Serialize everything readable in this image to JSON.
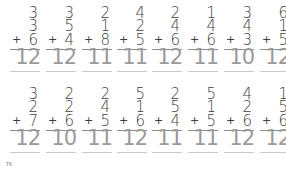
{
  "worksheet": {
    "rows": [
      {
        "problems": [
          {
            "a": "3",
            "b": "3",
            "c": "6",
            "op": "+",
            "answer": "12"
          },
          {
            "a": "3",
            "b": "5",
            "c": "4",
            "op": "+",
            "answer": "12"
          },
          {
            "a": "2",
            "b": "1",
            "c": "8",
            "op": "+",
            "answer": "11"
          },
          {
            "a": "4",
            "b": "2",
            "c": "5",
            "op": "+",
            "answer": "11"
          },
          {
            "a": "2",
            "b": "4",
            "c": "6",
            "op": "+",
            "answer": "12"
          },
          {
            "a": "1",
            "b": "4",
            "c": "6",
            "op": "+",
            "answer": "11"
          },
          {
            "a": "3",
            "b": "4",
            "c": "3",
            "op": "+",
            "answer": "10"
          },
          {
            "a": "6",
            "b": "1",
            "c": "5",
            "op": "+",
            "answer": "12"
          }
        ]
      },
      {
        "problems": [
          {
            "a": "3",
            "b": "2",
            "c": "7",
            "op": "+",
            "answer": "12"
          },
          {
            "a": "2",
            "b": "2",
            "c": "6",
            "op": "+",
            "answer": "10"
          },
          {
            "a": "2",
            "b": "4",
            "c": "5",
            "op": "+",
            "answer": "11"
          },
          {
            "a": "5",
            "b": "1",
            "c": "6",
            "op": "+",
            "answer": "12"
          },
          {
            "a": "2",
            "b": "5",
            "c": "4",
            "op": "+",
            "answer": "11"
          },
          {
            "a": "5",
            "b": "1",
            "c": "5",
            "op": "+",
            "answer": "11"
          },
          {
            "a": "4",
            "b": "2",
            "c": "6",
            "op": "+",
            "answer": "12"
          },
          {
            "a": "1",
            "b": "5",
            "c": "6",
            "op": "+",
            "answer": "12"
          }
        ]
      }
    ],
    "page_number": "T6"
  }
}
